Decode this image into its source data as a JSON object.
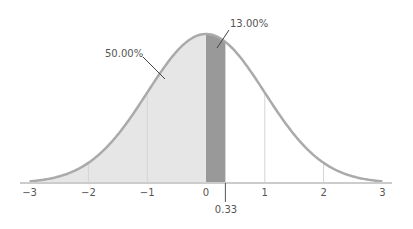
{
  "chart_data": {
    "type": "area",
    "title": "",
    "xlabel": "",
    "ylabel": "",
    "distribution": "standard normal",
    "mean": 0,
    "sd": 1,
    "xlim": [
      -3,
      3
    ],
    "x_ticks": [
      -3,
      -2,
      -1,
      0,
      1,
      2,
      3
    ],
    "x_tick_labels": [
      "−3",
      "−2",
      "−1",
      "0",
      "1",
      "2",
      "3"
    ],
    "grid": "vertical lines at integer ticks under curve",
    "shaded_regions": [
      {
        "name": "left half",
        "from": -3,
        "to": 0,
        "area_label": "50.00%",
        "color": "#e6e6e6"
      },
      {
        "name": "0 to 0.33",
        "from": 0,
        "to": 0.33,
        "area_label": "13.00%",
        "color": "#999999"
      }
    ],
    "marker": {
      "x": 0.33,
      "label": "0.33"
    },
    "annotations": [
      "50.00%",
      "13.00%",
      "0.33"
    ],
    "legend": "none"
  },
  "labels": {
    "left_area": "50.00%",
    "mid_area": "13.00%",
    "marker": "0.33",
    "ticks": [
      "−3",
      "−2",
      "−1",
      "0",
      "1",
      "2",
      "3"
    ]
  },
  "colors": {
    "curve": "#aaaaaa",
    "left_fill": "#e6e6e6",
    "mid_fill": "#999999",
    "axis": "#cccccc",
    "gridline": "#d4d4d4",
    "text": "#555555"
  }
}
